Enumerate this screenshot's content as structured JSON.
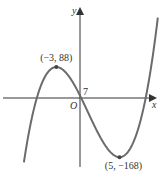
{
  "chart_data": {
    "type": "line",
    "title": "",
    "xlabel": "x",
    "ylabel": "y",
    "origin_label": "O",
    "function": "y = x^3 - 3x^2 - 45x + 7",
    "coefficients": [
      1,
      -3,
      -45,
      7
    ],
    "xlim": [
      -10,
      10
    ],
    "ylim": [
      -200,
      250
    ],
    "grid": false,
    "curve_color": "#6b6b6b",
    "axis_color": "#333333",
    "annotations": [
      {
        "label": "(−3, 88)",
        "x": -3,
        "y": 88,
        "kind": "maximum"
      },
      {
        "label": "(5, −168)",
        "x": 5,
        "y": -168,
        "kind": "minimum"
      },
      {
        "label": "7",
        "x": 0,
        "y": 7,
        "kind": "y-intercept"
      }
    ]
  }
}
